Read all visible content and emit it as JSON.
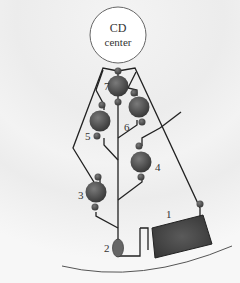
{
  "center": {
    "line1": "CD",
    "line2": "center"
  },
  "components": [
    {
      "id": "1",
      "label": "1",
      "kind": "chamber"
    },
    {
      "id": "2",
      "label": "2",
      "kind": "valve"
    },
    {
      "id": "3",
      "label": "3",
      "kind": "reservoir"
    },
    {
      "id": "4",
      "label": "4",
      "kind": "reservoir"
    },
    {
      "id": "5",
      "label": "5",
      "kind": "reservoir"
    },
    {
      "id": "6",
      "label": "6",
      "kind": "reservoir"
    },
    {
      "id": "7",
      "label": "7",
      "kind": "reservoir"
    }
  ],
  "colors": {
    "sphere": "#4a4a4a",
    "chamber": "#3d3d3d",
    "line": "#222222",
    "valve": "#666666"
  }
}
